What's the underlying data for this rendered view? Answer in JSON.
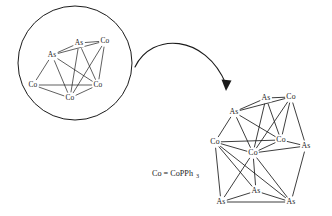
{
  "figure": {
    "legend": {
      "text_main": "Co = CoPPh",
      "text_sub": "3",
      "x": 152,
      "y": 174
    },
    "inset_circle": {
      "cx": 75,
      "cy": 63,
      "r": 57
    },
    "arrow": {
      "name": "magnification-arrow",
      "path": "M 135 67 C 152 32, 205 34, 226 84",
      "head_points": "226,91 221.5,79.5 231.5,80.5"
    }
  },
  "chart_data": {
    "type": "diagram",
    "subtitle": "Circled inset shows magnified core fragment; arrow points to full cluster",
    "legend_entries": [
      "Co = CoPPh3"
    ],
    "inset_cluster": {
      "name": "magnified-core-fragment",
      "atoms": [
        {
          "id": "i-as-top",
          "element": "As",
          "x": 79,
          "y": 43
        },
        {
          "id": "i-co-topr",
          "element": "Co",
          "x": 105,
          "y": 41
        },
        {
          "id": "i-as-left",
          "element": "As",
          "x": 52,
          "y": 55
        },
        {
          "id": "i-co-left",
          "element": "Co",
          "x": 33,
          "y": 85
        },
        {
          "id": "i-co-right",
          "element": "Co",
          "x": 98,
          "y": 85
        },
        {
          "id": "i-co-bot",
          "element": "Co",
          "x": 70,
          "y": 98
        }
      ],
      "bonds": [
        [
          "i-as-top",
          "i-co-topr"
        ],
        [
          "i-as-top",
          "i-as-left"
        ],
        [
          "i-as-top",
          "i-co-right"
        ],
        [
          "i-as-top",
          "i-co-bot"
        ],
        [
          "i-as-left",
          "i-co-topr"
        ],
        [
          "i-as-left",
          "i-co-left"
        ],
        [
          "i-as-left",
          "i-co-bot"
        ],
        [
          "i-as-left",
          "i-co-right"
        ],
        [
          "i-co-topr",
          "i-co-right"
        ],
        [
          "i-co-topr",
          "i-co-bot"
        ],
        [
          "i-co-left",
          "i-co-bot"
        ],
        [
          "i-co-left",
          "i-co-right"
        ],
        [
          "i-co-bot",
          "i-co-right"
        ]
      ]
    },
    "main_cluster": {
      "name": "full-cluster",
      "atoms": [
        {
          "id": "m-as-top",
          "element": "As",
          "x": 266,
          "y": 98
        },
        {
          "id": "m-co-topr",
          "element": "Co",
          "x": 291,
          "y": 97
        },
        {
          "id": "m-as-upl",
          "element": "As",
          "x": 234,
          "y": 112
        },
        {
          "id": "m-co-left",
          "element": "Co",
          "x": 215,
          "y": 142
        },
        {
          "id": "m-co-mid",
          "element": "Co",
          "x": 253,
          "y": 153
        },
        {
          "id": "m-co-right",
          "element": "Co",
          "x": 281,
          "y": 140
        },
        {
          "id": "m-as-right",
          "element": "As",
          "x": 306,
          "y": 146
        },
        {
          "id": "m-as-botmid",
          "element": "As",
          "x": 256,
          "y": 191
        },
        {
          "id": "m-as-botl",
          "element": "As",
          "x": 221,
          "y": 202
        },
        {
          "id": "m-as-botr",
          "element": "As",
          "x": 291,
          "y": 202
        }
      ],
      "bonds": [
        [
          "m-as-top",
          "m-co-topr"
        ],
        [
          "m-as-top",
          "m-as-upl"
        ],
        [
          "m-as-top",
          "m-co-right"
        ],
        [
          "m-as-top",
          "m-co-mid"
        ],
        [
          "m-as-upl",
          "m-co-topr"
        ],
        [
          "m-as-upl",
          "m-co-left"
        ],
        [
          "m-as-upl",
          "m-co-mid"
        ],
        [
          "m-as-upl",
          "m-co-right"
        ],
        [
          "m-co-topr",
          "m-co-right"
        ],
        [
          "m-co-topr",
          "m-co-mid"
        ],
        [
          "m-co-topr",
          "m-as-right"
        ],
        [
          "m-co-left",
          "m-co-mid"
        ],
        [
          "m-co-left",
          "m-co-right"
        ],
        [
          "m-co-mid",
          "m-co-right"
        ],
        [
          "m-co-right",
          "m-as-right"
        ],
        [
          "m-co-mid",
          "m-as-right"
        ],
        [
          "m-co-left",
          "m-as-botl"
        ],
        [
          "m-co-left",
          "m-as-botmid"
        ],
        [
          "m-co-left",
          "m-as-botr"
        ],
        [
          "m-co-mid",
          "m-as-botmid"
        ],
        [
          "m-co-mid",
          "m-as-botl"
        ],
        [
          "m-co-mid",
          "m-as-botr"
        ],
        [
          "m-as-right",
          "m-as-botr"
        ],
        [
          "m-as-botmid",
          "m-as-botl"
        ],
        [
          "m-as-botmid",
          "m-as-botr"
        ],
        [
          "m-as-botl",
          "m-as-botr"
        ]
      ]
    }
  }
}
